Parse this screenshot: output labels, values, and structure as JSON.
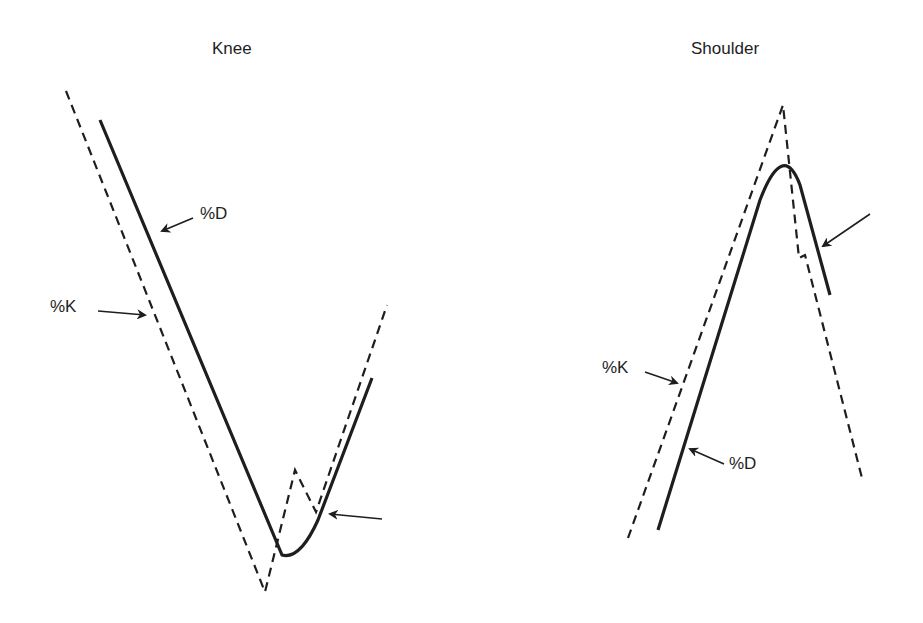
{
  "panels": [
    {
      "title": "Knee",
      "labels": {
        "d": "%D",
        "k": "%K"
      }
    },
    {
      "title": "Shoulder",
      "labels": {
        "d": "%D",
        "k": "%K"
      }
    }
  ],
  "colors": {
    "line": "#1e1e1e",
    "background": "#ffffff"
  },
  "legend_semantics": {
    "dashed": "%K",
    "solid": "%D"
  }
}
